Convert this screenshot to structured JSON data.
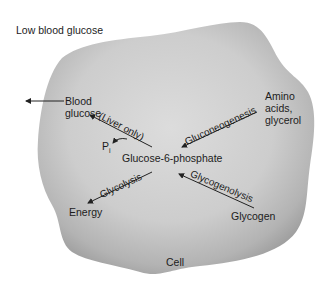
{
  "diagram": {
    "title": "Low blood glucose",
    "container_label": "Cell",
    "nodes": {
      "blood_glucose": [
        "Blood",
        "glucose"
      ],
      "amino_acids": [
        "Amino",
        "acids,",
        "glycerol"
      ],
      "center": "Glucose-6-phosphate",
      "pi": "P",
      "pi_sub": "i",
      "energy": "Energy",
      "glycogen": "Glycogen"
    },
    "edges": {
      "liver_only": "(Liver only)",
      "gluconeogenesis": "Gluconeogenesis",
      "glycolysis": "Glycolysis",
      "glycogenolysis": "Glycogenolysis"
    },
    "relationships": [
      {
        "from": "Amino acids, glycerol",
        "to": "Glucose-6-phosphate",
        "label": "Gluconeogenesis"
      },
      {
        "from": "Glycogen",
        "to": "Glucose-6-phosphate",
        "label": "Glycogenolysis"
      },
      {
        "from": "Glucose-6-phosphate",
        "to": "Energy",
        "label": "Glycolysis"
      },
      {
        "from": "Glucose-6-phosphate",
        "to": "Blood glucose",
        "label": "(Liver only)",
        "byproduct": "Pi"
      },
      {
        "from": "Blood glucose",
        "to": "outside cell",
        "label": ""
      }
    ],
    "colors": {
      "cell_fill_light": "#d8d8d8",
      "cell_fill_dark": "#a9a9a9",
      "text": "#1c1c1c",
      "arrow": "#222222"
    }
  }
}
